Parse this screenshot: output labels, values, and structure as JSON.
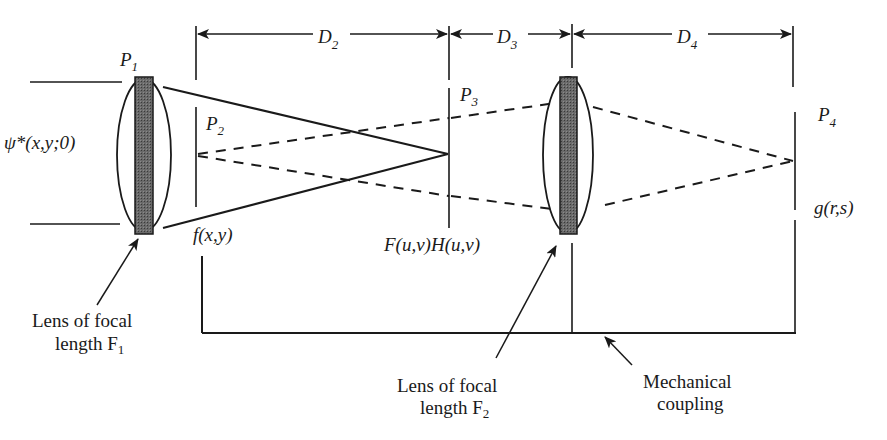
{
  "figure": {
    "type": "optical-system-diagram"
  },
  "colors": {
    "ink": "#1a1a1a",
    "lens_fill": "#555555",
    "background": "#ffffff"
  },
  "dimensions": {
    "d2": {
      "label": "D",
      "sub": "2"
    },
    "d3": {
      "label": "D",
      "sub": "3"
    },
    "d4": {
      "label": "D",
      "sub": "4"
    }
  },
  "planes": {
    "p1": {
      "label": "P",
      "sub": "1"
    },
    "p2": {
      "label": "P",
      "sub": "2"
    },
    "p3": {
      "label": "P",
      "sub": "3"
    },
    "p4": {
      "label": "P",
      "sub": "4"
    }
  },
  "signals": {
    "input": "ψ*(x,y;0)",
    "object": "f(x,y)",
    "fourier": "F(u,v)H(u,v)",
    "output": "g(r,s)"
  },
  "annotations": {
    "lens1": {
      "line1": "Lens of focal",
      "line2": "length F",
      "sub": "1"
    },
    "lens2": {
      "line1": "Lens of focal",
      "line2": "length F",
      "sub": "2"
    },
    "coupling": {
      "line1": "Mechanical",
      "line2": "coupling"
    }
  }
}
